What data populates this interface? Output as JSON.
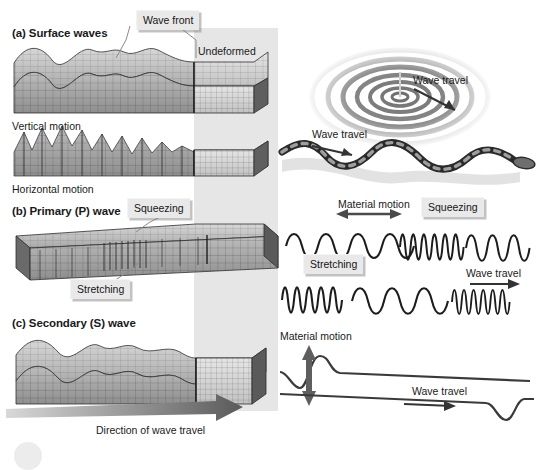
{
  "figure": {
    "kind": "seismic-wave-types-diagram",
    "background": "#ffffff",
    "ink": "#1a1a1a",
    "callout_fill": "#e9e9e9",
    "band_fill": "#e2e2e2",
    "block_fill": "#9a9a9a",
    "block_fill_light": "#c9c9c9"
  },
  "left_column": {
    "panel_a": {
      "heading": "(a) Surface waves",
      "sub_label_1": "Vertical motion",
      "sub_label_2": "Horizontal motion",
      "callout_wave_front": "Wave front",
      "label_undeformed": "Undeformed"
    },
    "panel_b": {
      "heading": "(b) Primary (P) wave",
      "callout_squeezing": "Squeezing",
      "callout_stretching": "Stretching"
    },
    "panel_c": {
      "heading": "(c) Secondary (S) wave"
    },
    "direction_arrow_label": "Direction of wave travel"
  },
  "right_column": {
    "ripples": {
      "label_wave_travel": "Wave travel"
    },
    "rope": {
      "label_wave_travel": "Wave travel"
    },
    "spring_compression": {
      "label_material_motion": "Material motion",
      "callout_squeezing": "Squeezing",
      "callout_stretching": "Stretching"
    },
    "spring_travel": {
      "label_wave_travel": "Wave travel"
    },
    "pulse": {
      "label_material_motion": "Material motion",
      "label_wave_travel": "Wave travel"
    }
  }
}
